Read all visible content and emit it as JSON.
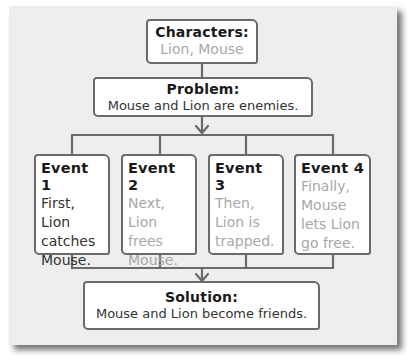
{
  "characters": {
    "heading": "Characters:",
    "text": "Lion, Mouse"
  },
  "problem": {
    "heading": "Problem:",
    "text": "Mouse and Lion are enemies."
  },
  "events": [
    {
      "heading": "Event 1",
      "lines": [
        "First,",
        "Lion",
        "catches",
        "Mouse."
      ],
      "filled": true
    },
    {
      "heading": "Event 2",
      "lines": [
        "Next,",
        "Lion",
        "frees",
        "Mouse."
      ],
      "filled": false
    },
    {
      "heading": "Event 3",
      "lines": [
        "Then,",
        "Lion is",
        "trapped."
      ],
      "filled": false
    },
    {
      "heading": "Event 4",
      "lines": [
        "Finally,",
        "Mouse",
        "lets Lion",
        "go free."
      ],
      "filled": false
    }
  ],
  "solution": {
    "heading": "Solution:",
    "text": "Mouse and Lion become friends."
  },
  "colors": {
    "paper": "#eeeeee",
    "border": "#6a6a6a",
    "muted_text": "#a8a8a8"
  }
}
